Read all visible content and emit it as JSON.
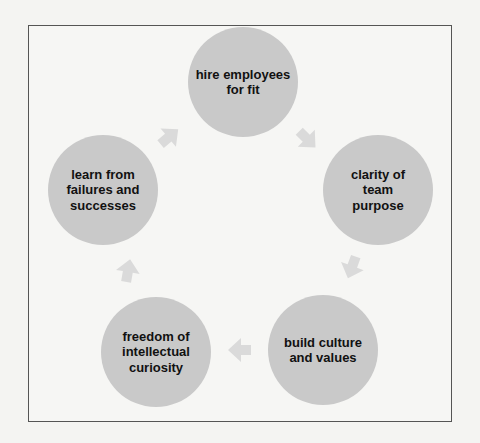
{
  "diagram": {
    "type": "cycle",
    "nodes": [
      {
        "id": "hire",
        "label": "hire employees for fit"
      },
      {
        "id": "clarity",
        "label": "clarity of team purpose"
      },
      {
        "id": "culture",
        "label": "build culture and values"
      },
      {
        "id": "freedom",
        "label": "freedom of intellectual curiosity"
      },
      {
        "id": "learn",
        "label": "learn from failures and successes"
      }
    ],
    "edges": [
      {
        "from": "hire",
        "to": "clarity"
      },
      {
        "from": "clarity",
        "to": "culture"
      },
      {
        "from": "culture",
        "to": "freedom"
      },
      {
        "from": "freedom",
        "to": "learn"
      },
      {
        "from": "learn",
        "to": "hire"
      }
    ],
    "colors": {
      "node_fill": "#c9c9c9",
      "arrow_fill": "#dadada",
      "frame_border": "#555555",
      "text": "#111111"
    }
  }
}
